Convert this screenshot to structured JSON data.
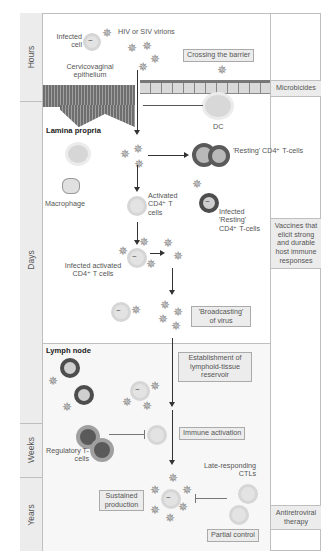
{
  "time_axis": {
    "hours": "Hours",
    "days": "Days",
    "weeks": "Weeks",
    "years": "Years"
  },
  "labels": {
    "infected_cell": "Infected cell",
    "virions": "HIV or SIV virions",
    "epithelium": "Cervicovaginal epithelium",
    "lamina_propria": "Lamina propria",
    "dc": "DC",
    "macrophage": "Macrophage",
    "activated_cd4": "Activated CD4⁺ T cells",
    "resting_cd4": "'Resting' CD4⁺ T-cells",
    "infected_resting": "Infected 'Resting' CD4⁺ T-cells",
    "infected_activated": "Infected activated CD4⁺ T cells",
    "lymph_node": "Lymph node",
    "regulatory": "Regulatory T-cells",
    "late_ctl": "Late-responding CTLs"
  },
  "stage_boxes": {
    "crossing": "Crossing the barrier",
    "broadcasting": "'Broadcasting' of virus",
    "establishment": "Establishment of lymphoid-tissue reservoir",
    "immune_activation": "Immune activation",
    "sustained": "Sustained production",
    "partial_control": "Partial control"
  },
  "interventions": {
    "microbicides": "Microbicides",
    "vaccines": "Vaccines that elicit strong and durable host immune responses",
    "antiretroviral": "Antiretroviral therapy"
  },
  "colors": {
    "panel_grey": "#ececec",
    "border": "#bfbfbf",
    "dark_cell": "#5a5a5a",
    "virion": "#888888"
  }
}
